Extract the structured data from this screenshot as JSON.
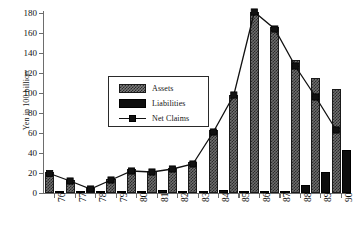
{
  "chart_data": {
    "type": "bar",
    "title": "",
    "subtitle": "",
    "xlabel": "",
    "ylabel": "Yen in 100 billion",
    "categories": [
      "76",
      "77",
      "78",
      "79",
      "80",
      "81",
      "82",
      "83",
      "84",
      "85",
      "86",
      "87",
      "88",
      "89",
      "90"
    ],
    "ylim": [
      0,
      180
    ],
    "ytick_values": [
      0,
      20,
      40,
      60,
      80,
      100,
      120,
      140,
      160,
      180
    ],
    "ytick_labels": [
      "0",
      "20",
      "40",
      "60",
      "80",
      "100",
      "120",
      "140",
      "160",
      "180"
    ],
    "grid": false,
    "legend_position": "upper-left-inside",
    "series": [
      {
        "name": "Assets",
        "render": "bar",
        "values": [
          21,
          13,
          5.5,
          14,
          24,
          22.5,
          25,
          31,
          63,
          98,
          181,
          166,
          133,
          115,
          104
        ]
      },
      {
        "name": "Liabilities",
        "render": "bar",
        "values": [
          1.5,
          1.5,
          1,
          1,
          2.5,
          3,
          2.5,
          2,
          3,
          2.5,
          1,
          2.5,
          8,
          21,
          43
        ]
      },
      {
        "name": "Net Claims",
        "render": "line-marker",
        "values": [
          19.5,
          12,
          4,
          13,
          22,
          21,
          24,
          29,
          61,
          98,
          181,
          164,
          127,
          96,
          63
        ]
      }
    ]
  },
  "legend": {
    "items": [
      {
        "label": "Assets"
      },
      {
        "label": "Liabilities"
      },
      {
        "label": "Net Claims"
      }
    ]
  },
  "colors": {
    "assets_fill": "#6e6e6e",
    "assets_hatch": "#2b2b2b",
    "liabilities_fill": "#0d0d0d",
    "net_claims_line": "#111111",
    "axis": "#6d6d6d",
    "text": "#111111",
    "background": "#ffffff"
  }
}
